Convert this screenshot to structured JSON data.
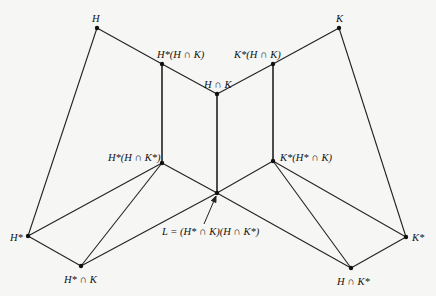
{
  "diagram": {
    "type": "subgroup-lattice (Zassenhaus butterfly)",
    "colors": {
      "line": "#222222",
      "node": "#111111",
      "background": "#f6f6f4"
    },
    "nodes": [
      {
        "id": "H",
        "label": "H",
        "x": 97,
        "y": 28,
        "lx": 92,
        "ly": 14
      },
      {
        "id": "HsHK",
        "label": "H*(H ∩ K)",
        "x": 162,
        "y": 64,
        "lx": 157,
        "ly": 50
      },
      {
        "id": "HK",
        "label": "H ∩ K",
        "x": 217,
        "y": 94,
        "lx": 204,
        "ly": 80
      },
      {
        "id": "KsHK",
        "label": "K*(H ∩ K)",
        "x": 273,
        "y": 64,
        "lx": 234,
        "ly": 50
      },
      {
        "id": "K",
        "label": "K",
        "x": 339,
        "y": 28,
        "lx": 336,
        "ly": 14
      },
      {
        "id": "HsHKs",
        "label": "H*(H ∩ K*)",
        "x": 162,
        "y": 163,
        "lx": 108,
        "ly": 153
      },
      {
        "id": "KsHsK",
        "label": "K*(H* ∩ K)",
        "x": 273,
        "y": 161,
        "lx": 280,
        "ly": 153
      },
      {
        "id": "L",
        "label": "",
        "x": 217,
        "y": 193,
        "lx": 0,
        "ly": 0
      },
      {
        "id": "Hs",
        "label": "H*",
        "x": 28,
        "y": 236,
        "lx": 10,
        "ly": 233
      },
      {
        "id": "HsK",
        "label": "H* ∩ K",
        "x": 81,
        "y": 266,
        "lx": 64,
        "ly": 275
      },
      {
        "id": "HKs",
        "label": "H ∩ K*",
        "x": 351,
        "y": 268,
        "lx": 337,
        "ly": 277
      },
      {
        "id": "Ks",
        "label": "K*",
        "x": 406,
        "y": 237,
        "lx": 412,
        "ly": 233
      }
    ],
    "edges": [
      [
        "H",
        "HsHK"
      ],
      [
        "HsHK",
        "HK"
      ],
      [
        "HK",
        "KsHK"
      ],
      [
        "KsHK",
        "K"
      ],
      [
        "H",
        "Hs"
      ],
      [
        "K",
        "Ks"
      ],
      [
        "HsHK",
        "HsHKs"
      ],
      [
        "HK",
        "L"
      ],
      [
        "KsHK",
        "KsHsK"
      ],
      [
        "HsHKs",
        "L"
      ],
      [
        "L",
        "KsHsK"
      ],
      [
        "HsHKs",
        "Hs"
      ],
      [
        "HsHKs",
        "HsK"
      ],
      [
        "Hs",
        "HsK"
      ],
      [
        "HsK",
        "L"
      ],
      [
        "KsHsK",
        "Ks"
      ],
      [
        "KsHsK",
        "HKs"
      ],
      [
        "Ks",
        "HKs"
      ],
      [
        "HKs",
        "L"
      ]
    ],
    "annotation": {
      "text": "L = (H* ∩ K)(H ∩ K*)",
      "x": 162,
      "y": 203,
      "arrow": {
        "from": [
          204,
          224
        ],
        "to": [
          216,
          196
        ]
      }
    }
  }
}
